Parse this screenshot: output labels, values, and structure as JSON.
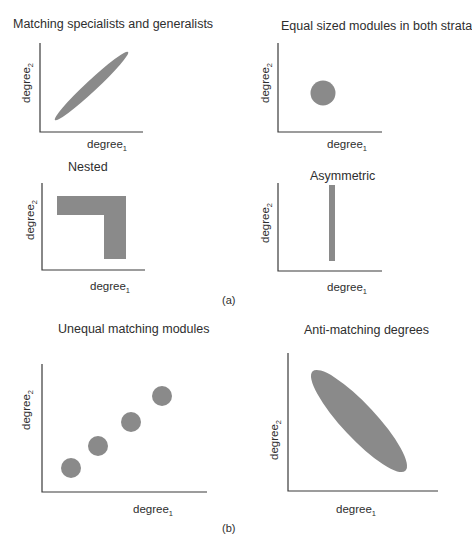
{
  "figure": {
    "subfigure_labels": {
      "a": "(a)",
      "b": "(b)"
    },
    "axis": {
      "x_base": "degree",
      "x_sub": "1",
      "y_base": "degree",
      "y_sub": "2"
    },
    "fill_color": "#8a8a8a",
    "axis_color": "#3a3a3a",
    "panels": [
      {
        "id": "matching",
        "title": "Matching specialists and generalists",
        "shape": "ellipse-positive-diagonal"
      },
      {
        "id": "equal",
        "title": "Equal sized modules in both strata",
        "shape": "circle"
      },
      {
        "id": "nested",
        "title": "Nested",
        "shape": "L-shape"
      },
      {
        "id": "asymmetric",
        "title": "Asymmetric",
        "shape": "vertical-bar"
      },
      {
        "id": "unequal",
        "title": "Unequal matching modules",
        "shape": "four-circles-diagonal"
      },
      {
        "id": "anti",
        "title": "Anti-matching degrees",
        "shape": "ellipse-negative-diagonal"
      }
    ]
  }
}
